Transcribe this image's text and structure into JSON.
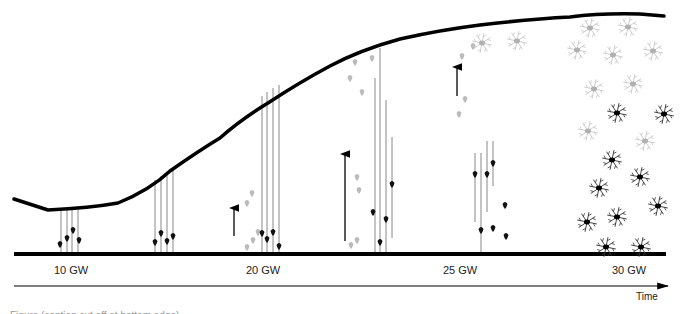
{
  "figure": {
    "stages": [
      {
        "label": "10 GW",
        "x": 54
      },
      {
        "label": "20 GW",
        "x": 246
      },
      {
        "label": "25 GW",
        "x": 443
      },
      {
        "label": "30 GW",
        "x": 612
      }
    ],
    "time_axis": {
      "label": "Time"
    },
    "caption": "Figure (caption cut off at bottom edge)",
    "colors": {
      "surface": "#000000",
      "fiber": "#888888",
      "neuron_dark": "#111111",
      "neuron_light": "#bbbbbb"
    }
  },
  "elements": {
    "pial_surface_path": "M14,199 L48,210 Q90,208 118,203 Q150,190 170,171 Q200,150 220,138 Q240,120 268,103 Q300,82 330,66 Q360,50 400,39 Q440,30 480,25 Q530,19 570,17 Q600,13 640,14 L664,16",
    "ventricular_line": {
      "x1": 14,
      "y1": 254,
      "x2": 666,
      "y2": 254
    },
    "time_axis_line": {
      "x1": 14,
      "y1": 286,
      "x2": 668,
      "y2": 286
    },
    "fibers": [
      {
        "x": 61,
        "y1": 208,
        "y2": 254
      },
      {
        "x": 67,
        "y1": 208,
        "y2": 254
      },
      {
        "x": 72,
        "y1": 208,
        "y2": 254
      },
      {
        "x": 78,
        "y1": 207,
        "y2": 254
      },
      {
        "x": 155,
        "y1": 180,
        "y2": 254
      },
      {
        "x": 161,
        "y1": 176,
        "y2": 254
      },
      {
        "x": 167,
        "y1": 172,
        "y2": 254
      },
      {
        "x": 173,
        "y1": 168,
        "y2": 254
      },
      {
        "x": 262,
        "y1": 96,
        "y2": 254
      },
      {
        "x": 267,
        "y1": 92,
        "y2": 254
      },
      {
        "x": 273,
        "y1": 88,
        "y2": 254
      },
      {
        "x": 279,
        "y1": 85,
        "y2": 254
      },
      {
        "x": 375,
        "y1": 78,
        "y2": 254
      },
      {
        "x": 380,
        "y1": 48,
        "y2": 254
      },
      {
        "x": 386,
        "y1": 100,
        "y2": 254
      },
      {
        "x": 392,
        "y1": 137,
        "y2": 238
      },
      {
        "x": 475,
        "y1": 153,
        "y2": 222
      },
      {
        "x": 481,
        "y1": 153,
        "y2": 254
      },
      {
        "x": 487,
        "y1": 141,
        "y2": 212
      },
      {
        "x": 493,
        "y1": 141,
        "y2": 186
      }
    ],
    "neurons_dark": [
      {
        "x": 60,
        "y": 244
      },
      {
        "x": 67,
        "y": 238
      },
      {
        "x": 73,
        "y": 230
      },
      {
        "x": 79,
        "y": 240
      },
      {
        "x": 155,
        "y": 242
      },
      {
        "x": 161,
        "y": 233
      },
      {
        "x": 167,
        "y": 241
      },
      {
        "x": 173,
        "y": 236
      },
      {
        "x": 262,
        "y": 233
      },
      {
        "x": 267,
        "y": 239
      },
      {
        "x": 273,
        "y": 232
      },
      {
        "x": 279,
        "y": 246
      },
      {
        "x": 373,
        "y": 212
      },
      {
        "x": 380,
        "y": 242
      },
      {
        "x": 386,
        "y": 219
      },
      {
        "x": 392,
        "y": 184
      },
      {
        "x": 475,
        "y": 174
      },
      {
        "x": 481,
        "y": 230
      },
      {
        "x": 487,
        "y": 174
      },
      {
        "x": 493,
        "y": 163
      },
      {
        "x": 505,
        "y": 205
      },
      {
        "x": 493,
        "y": 228
      },
      {
        "x": 506,
        "y": 236
      }
    ],
    "neurons_light": [
      {
        "x": 247,
        "y": 247
      },
      {
        "x": 253,
        "y": 240
      },
      {
        "x": 247,
        "y": 203
      },
      {
        "x": 252,
        "y": 193
      },
      {
        "x": 258,
        "y": 232
      },
      {
        "x": 351,
        "y": 245
      },
      {
        "x": 357,
        "y": 240
      },
      {
        "x": 359,
        "y": 190
      },
      {
        "x": 357,
        "y": 177
      },
      {
        "x": 362,
        "y": 92
      },
      {
        "x": 350,
        "y": 78
      },
      {
        "x": 355,
        "y": 62
      },
      {
        "x": 372,
        "y": 58
      },
      {
        "x": 459,
        "y": 114
      },
      {
        "x": 465,
        "y": 99
      },
      {
        "x": 462,
        "y": 56
      },
      {
        "x": 473,
        "y": 46
      }
    ],
    "arrows": [
      {
        "x": 234,
        "y1": 236,
        "y2": 204
      },
      {
        "x": 345,
        "y1": 241,
        "y2": 150
      },
      {
        "x": 457,
        "y1": 96,
        "y2": 63
      }
    ],
    "stellate_light": [
      {
        "x": 482,
        "y": 43
      },
      {
        "x": 517,
        "y": 41
      },
      {
        "x": 590,
        "y": 28
      },
      {
        "x": 628,
        "y": 27
      },
      {
        "x": 577,
        "y": 50
      },
      {
        "x": 613,
        "y": 55
      },
      {
        "x": 653,
        "y": 51
      },
      {
        "x": 594,
        "y": 89
      },
      {
        "x": 633,
        "y": 84
      },
      {
        "x": 588,
        "y": 131
      },
      {
        "x": 645,
        "y": 141
      }
    ],
    "stellate_dark": [
      {
        "x": 617,
        "y": 113
      },
      {
        "x": 664,
        "y": 114
      },
      {
        "x": 612,
        "y": 160
      },
      {
        "x": 640,
        "y": 177
      },
      {
        "x": 599,
        "y": 188
      },
      {
        "x": 658,
        "y": 206
      },
      {
        "x": 587,
        "y": 222
      },
      {
        "x": 617,
        "y": 217
      },
      {
        "x": 606,
        "y": 247
      },
      {
        "x": 641,
        "y": 247
      }
    ]
  }
}
